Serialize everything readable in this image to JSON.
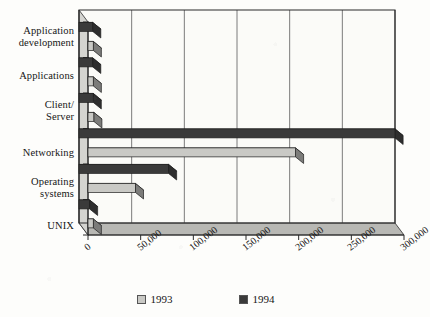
{
  "chart_data": {
    "type": "bar",
    "orientation": "horizontal",
    "title": "",
    "xlabel": "",
    "ylabel": "",
    "xlim": [
      0,
      300000
    ],
    "grid": true,
    "legend_position": "bottom",
    "style": "3d-horizontal-bar",
    "categories": [
      "Application development",
      "Applications",
      "Client/ Server",
      "Networking",
      "Operating systems",
      "UNIX"
    ],
    "category_lines": [
      [
        "Application",
        "development"
      ],
      [
        "Applications"
      ],
      [
        "Client/",
        "Server"
      ],
      [
        "Networking"
      ],
      [
        "Operating",
        "systems"
      ],
      [
        "UNIX"
      ]
    ],
    "xticks": [
      0,
      50000,
      100000,
      150000,
      200000,
      250000,
      300000
    ],
    "xtick_labels": [
      "0",
      "50,000",
      "100,000",
      "150,000",
      "200,000",
      "250,000",
      "300,000"
    ],
    "series": [
      {
        "name": "1993",
        "color": "#c9c9c5",
        "values": [
          5000,
          5000,
          5500,
          197000,
          45000,
          5000
        ]
      },
      {
        "name": "1994",
        "color": "#3a3a3a",
        "values": [
          13000,
          13000,
          13500,
          300000,
          85000,
          10000
        ]
      }
    ],
    "legend": [
      {
        "label": "1993",
        "color": "#c9c9c5"
      },
      {
        "label": "1994",
        "color": "#3a3a3a"
      }
    ]
  },
  "colors": {
    "background": "#fdfdfb",
    "plot_face": "#fbfbf8",
    "axis": "#2a2a2a",
    "gridline": "#5a5a5a",
    "floor": "#b8b8b4",
    "wall_side": "#d4d4d0",
    "series_1993": "#c9c9c5",
    "series_1994": "#3a3a3a"
  }
}
